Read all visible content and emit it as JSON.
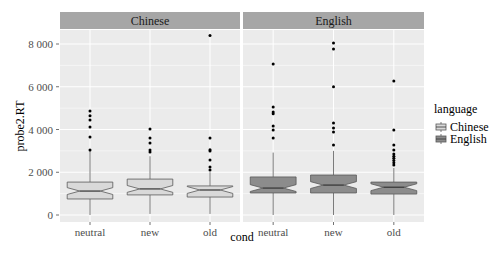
{
  "chart_data": {
    "type": "boxplot",
    "title": "",
    "xlabel": "cond",
    "ylabel": "probe2.RT",
    "ylim": [
      -330,
      8650
    ],
    "yticks": [
      0,
      2000,
      4000,
      6000,
      8000
    ],
    "ytick_labels": [
      "0",
      "2 000",
      "4 000",
      "6 000",
      "8 000"
    ],
    "categories": [
      "neutral",
      "new",
      "old"
    ],
    "facets": [
      "Chinese",
      "English"
    ],
    "notched": true,
    "grid": true,
    "legend": {
      "title": "language",
      "position": "right",
      "entries": [
        {
          "label": "Chinese",
          "fill": "#d9d9d9"
        },
        {
          "label": "English",
          "fill": "#8c8c8c"
        }
      ]
    },
    "series": [
      {
        "name": "Chinese",
        "fill": "#d9d9d9",
        "boxes": [
          {
            "category": "neutral",
            "whisker_low": 0,
            "q1": 750,
            "median": 1120,
            "q3": 1540,
            "whisker_high": 3000,
            "outliers": [
              3040,
              3650,
              4120,
              4440,
              4640,
              4870
            ]
          },
          {
            "category": "new",
            "whisker_low": 50,
            "q1": 940,
            "median": 1220,
            "q3": 1680,
            "whisker_high": 2750,
            "outliers": [
              2950,
              3040,
              3370,
              3600,
              4020
            ]
          },
          {
            "category": "old",
            "whisker_low": 50,
            "q1": 840,
            "median": 1170,
            "q3": 1360,
            "whisker_high": 2000,
            "outliers": [
              2100,
              2250,
              2570,
              3000,
              3050,
              3600,
              8400
            ]
          }
        ]
      },
      {
        "name": "English",
        "fill": "#8c8c8c",
        "boxes": [
          {
            "category": "neutral",
            "whisker_low": 0,
            "q1": 1030,
            "median": 1260,
            "q3": 1780,
            "whisker_high": 2920,
            "outliers": [
              3600,
              3980,
              4160,
              4740,
              4820,
              5050,
              7060
            ]
          },
          {
            "category": "new",
            "whisker_low": 0,
            "q1": 1030,
            "median": 1400,
            "q3": 1870,
            "whisker_high": 3000,
            "outliers": [
              3270,
              3880,
              4070,
              4300,
              6000,
              7770,
              8050
            ]
          },
          {
            "category": "old",
            "whisker_low": 0,
            "q1": 980,
            "median": 1300,
            "q3": 1540,
            "whisker_high": 2200,
            "outliers": [
              2340,
              2450,
              2550,
              2650,
              2750,
              2850,
              3040,
              3270,
              3980,
              6270
            ]
          }
        ]
      }
    ]
  },
  "colors": {
    "panel_bg": "#ebebeb",
    "strip_bg": "#a6a6a6",
    "grid": "#ffffff",
    "box_outline": "#595959",
    "point": "#000000"
  }
}
